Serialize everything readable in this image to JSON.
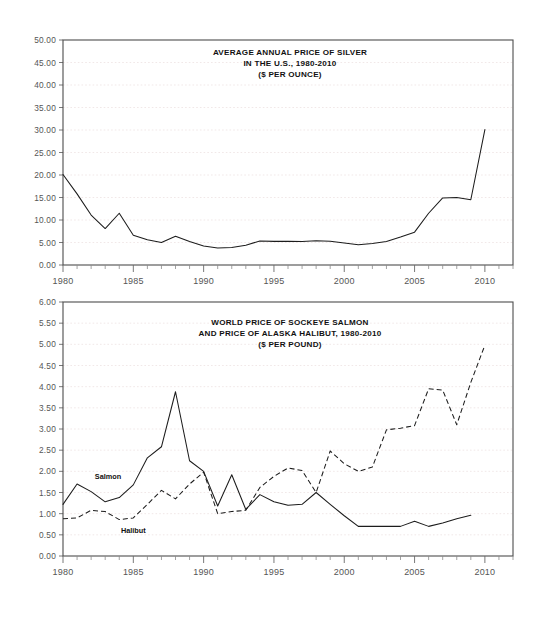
{
  "page": {
    "background": "#ffffff",
    "line_color": "#1c1c1c",
    "grid_color": "#e7d9d9",
    "axis_color": "#6a6a6a"
  },
  "chart_data": [
    {
      "id": "silver",
      "type": "line",
      "title": "AVERAGE ANNUAL PRICE OF SILVER\nIN THE U.S., 1980-2010\n($ PER OUNCE)",
      "title_lines": [
        "AVERAGE ANNUAL PRICE OF SILVER",
        "IN THE U.S., 1980-2010",
        "($ PER OUNCE)"
      ],
      "xlabel": "",
      "ylabel": "",
      "xlim": [
        1980,
        2012
      ],
      "ylim": [
        0,
        50
      ],
      "ytick_step": 5,
      "xtick_step": 5,
      "minor_xtick_step": 1,
      "grid": true,
      "legend": "none",
      "ytick_labels": [
        "0.00",
        "5.00",
        "10.00",
        "15.00",
        "20.00",
        "25.00",
        "30.00",
        "35.00",
        "40.00",
        "45.00",
        "50.00"
      ],
      "xtick_labels": [
        "1980",
        "1985",
        "1990",
        "1995",
        "2000",
        "2005",
        "2010"
      ],
      "x": [
        1980,
        1981,
        1982,
        1983,
        1984,
        1985,
        1986,
        1987,
        1988,
        1989,
        1990,
        1991,
        1992,
        1993,
        1994,
        1995,
        1996,
        1997,
        1998,
        1999,
        2000,
        2001,
        2002,
        2003,
        2004,
        2005,
        2006,
        2007,
        2008,
        2009,
        2010
      ],
      "series": [
        {
          "name": "Silver price",
          "style": "solid",
          "values": [
            20.1,
            15.8,
            11.1,
            8.1,
            11.5,
            6.6,
            5.6,
            5.0,
            6.4,
            5.2,
            4.2,
            3.8,
            3.9,
            4.4,
            5.35,
            5.25,
            5.25,
            5.2,
            5.4,
            5.3,
            4.9,
            4.5,
            4.8,
            5.2,
            6.2,
            7.3,
            11.5,
            14.9,
            15.0,
            14.5,
            30.1
          ]
        }
      ]
    },
    {
      "id": "fish",
      "type": "line",
      "title": "WORLD PRICE OF SOCKEYE SALMON\nAND PRICE OF ALASKA HALIBUT, 1980-2010\n($ PER POUND)",
      "title_lines": [
        "WORLD PRICE OF SOCKEYE SALMON",
        "AND PRICE OF ALASKA HALIBUT, 1980-2010",
        "($ PER POUND)"
      ],
      "xlabel": "",
      "ylabel": "",
      "xlim": [
        1980,
        2012
      ],
      "ylim": [
        0,
        6
      ],
      "ytick_step": 0.5,
      "xtick_step": 5,
      "minor_xtick_step": 1,
      "grid": true,
      "legend": "inline-labels",
      "ytick_labels": [
        "0.00",
        "0.50",
        "1.00",
        "1.50",
        "2.00",
        "2.50",
        "3.00",
        "3.50",
        "4.00",
        "4.50",
        "5.00",
        "5.50",
        "6.00"
      ],
      "xtick_labels": [
        "1980",
        "1985",
        "1990",
        "1995",
        "2000",
        "2005",
        "2010"
      ],
      "x": [
        1980,
        1981,
        1982,
        1983,
        1984,
        1985,
        1986,
        1987,
        1988,
        1989,
        1990,
        1991,
        1992,
        1993,
        1994,
        1995,
        1996,
        1997,
        1998,
        1999,
        2000,
        2001,
        2002,
        2003,
        2004,
        2005,
        2006,
        2007,
        2008,
        2009,
        2010
      ],
      "series": [
        {
          "name": "Salmon",
          "label": "Salmon",
          "style": "solid",
          "label_x": 1983.2,
          "label_y": 1.82,
          "values": [
            1.22,
            1.7,
            1.52,
            1.28,
            1.38,
            1.68,
            2.32,
            2.58,
            3.88,
            2.25,
            2.0,
            1.18,
            1.92,
            1.1,
            1.45,
            1.28,
            1.2,
            1.22,
            1.5,
            1.22,
            0.95,
            0.7,
            0.7,
            0.7,
            0.7,
            0.82,
            0.7,
            0.78,
            0.88,
            0.96,
            null
          ]
        },
        {
          "name": "Halibut",
          "label": "Halibut",
          "style": "dashed",
          "label_x": 1985.0,
          "label_y": 0.55,
          "values": [
            0.88,
            0.9,
            1.08,
            1.05,
            0.86,
            0.9,
            1.22,
            1.55,
            1.35,
            1.7,
            1.98,
            1.0,
            1.05,
            1.08,
            1.62,
            1.88,
            2.08,
            2.02,
            1.5,
            2.48,
            2.18,
            2.0,
            2.1,
            2.98,
            3.02,
            3.08,
            3.95,
            3.92,
            3.1,
            4.1,
            4.98
          ]
        }
      ]
    }
  ]
}
